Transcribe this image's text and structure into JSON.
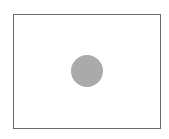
{
  "diagram": {
    "frame": {
      "shape": "rectangle",
      "stroke_color": "#6b6b6b",
      "fill_color": "#ffffff"
    },
    "circle": {
      "shape": "circle",
      "fill_color": "#aaaaaa",
      "center_x": 87,
      "center_y": 71,
      "radius": 16
    }
  }
}
